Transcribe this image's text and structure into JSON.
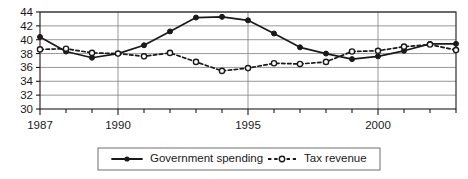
{
  "chart_data": {
    "type": "line",
    "title": "",
    "xlabel": "",
    "ylabel": "",
    "x": [
      1987,
      1988,
      1989,
      1990,
      1991,
      1992,
      1993,
      1994,
      1995,
      1996,
      1997,
      1998,
      1999,
      2000,
      2001,
      2002,
      2003
    ],
    "xlim": [
      1987,
      2003
    ],
    "ylim": [
      30,
      44
    ],
    "y_ticks": [
      30,
      32,
      34,
      36,
      38,
      40,
      42,
      44
    ],
    "x_ticks_labeled": [
      1987,
      1990,
      1995,
      2000
    ],
    "x_tick_labels": [
      "1987",
      "1990",
      "1995",
      "2000"
    ],
    "y_tick_labels": [
      "30",
      "32",
      "34",
      "36",
      "38",
      "40",
      "42",
      "44"
    ],
    "grid": true,
    "grid_axis": "y",
    "legend_position": "bottom",
    "series": [
      {
        "name": "Government spending",
        "style": "solid",
        "marker": "filled-circle",
        "color": "#1a1a1a",
        "values": [
          40.4,
          38.3,
          37.4,
          38.0,
          39.2,
          41.2,
          43.2,
          43.3,
          42.8,
          40.9,
          38.9,
          38.0,
          37.2,
          37.6,
          38.4,
          39.4,
          39.4
        ]
      },
      {
        "name": "Tax revenue",
        "style": "dashed",
        "marker": "open-circle",
        "color": "#1a1a1a",
        "values": [
          38.6,
          38.7,
          38.1,
          38.0,
          37.6,
          38.1,
          36.8,
          35.5,
          35.9,
          36.6,
          36.5,
          36.8,
          38.3,
          38.4,
          39.0,
          39.3,
          38.5
        ]
      }
    ]
  },
  "legend": {
    "items": [
      {
        "label": "Government spending",
        "marker": "filled-circle",
        "style": "solid"
      },
      {
        "label": "Tax revenue",
        "marker": "open-circle",
        "style": "dashed"
      }
    ]
  },
  "colors": {
    "axis": "#1a1a1a",
    "grid": "#8c8c8c",
    "series": "#1a1a1a",
    "background": "#ffffff",
    "legend_border": "#6e6e6e"
  }
}
